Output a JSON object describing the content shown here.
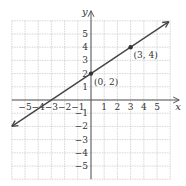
{
  "chart_data": {
    "type": "line",
    "title": "",
    "xlabel": "x",
    "ylabel": "y",
    "xlim": [
      -6,
      6
    ],
    "ylim": [
      -6,
      6
    ],
    "grid": true,
    "x_ticks": [
      -5,
      -4,
      -3,
      -2,
      -1,
      1,
      2,
      3,
      4,
      5
    ],
    "y_ticks": [
      -5,
      -4,
      -3,
      -2,
      -1,
      1,
      2,
      3,
      4,
      5
    ],
    "line": {
      "slope": 0.6667,
      "intercept": 2,
      "equation": "y = (2/3)x + 2",
      "arrows_both_ends": true
    },
    "points": [
      {
        "x": 0,
        "y": 2,
        "label": "(0, 2)"
      },
      {
        "x": 3,
        "y": 4,
        "label": "(3, 4)"
      }
    ],
    "colors": {
      "line": "#444444",
      "grid": "#bbbbbb",
      "axis": "#555555"
    }
  }
}
